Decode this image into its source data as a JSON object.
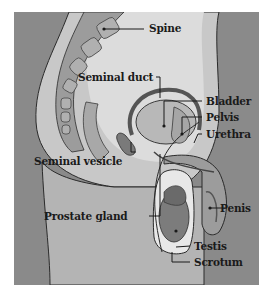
{
  "diagram": {
    "type": "anatomical-illustration",
    "colors": {
      "background_skin": "#8a8a8a",
      "body_interior": "#c4c4c4",
      "pelvic_cavity": "#d8d8d8",
      "organs": "#9a9a9a",
      "outlines": "#2a2a2a",
      "label_text": "#1a1a1a"
    },
    "labels": [
      {
        "id": "spine",
        "text": "Spine"
      },
      {
        "id": "seminal-duct",
        "text": "Seminal duct"
      },
      {
        "id": "bladder",
        "text": "Bladder"
      },
      {
        "id": "pelvis",
        "text": "Pelvis"
      },
      {
        "id": "urethra",
        "text": "Urethra"
      },
      {
        "id": "seminal-vesicle",
        "text": "Seminal vesicle"
      },
      {
        "id": "penis",
        "text": "Penis"
      },
      {
        "id": "prostate-gland",
        "text": "Prostate gland"
      },
      {
        "id": "testis",
        "text": "Testis"
      },
      {
        "id": "scrotum",
        "text": "Scrotum"
      }
    ]
  }
}
